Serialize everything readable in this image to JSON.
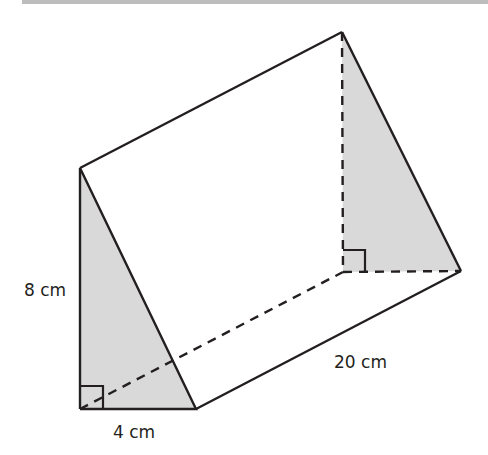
{
  "figure": {
    "type": "triangular prism",
    "labels": {
      "height": "8 cm",
      "base": "4 cm",
      "length": "20 cm"
    },
    "colors": {
      "stroke": "#231f20",
      "shade": "#d9d9d9",
      "background": "#ffffff"
    }
  }
}
